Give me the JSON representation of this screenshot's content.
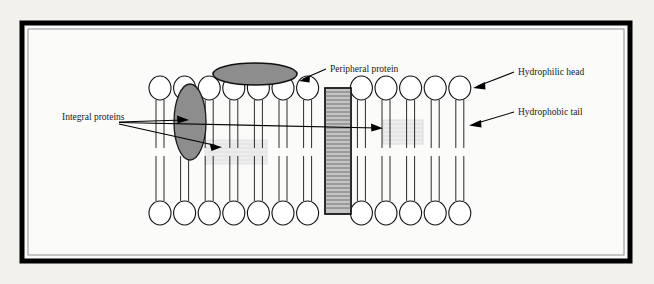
{
  "figure": {
    "kind": "cell-membrane-phospholipid-bilayer-diagram",
    "background_color": "#f2f1ee",
    "frame": {
      "outer_color": "#000000",
      "inner_line_color": "#8a8a8a",
      "fill_color": "#fbfbfa"
    }
  },
  "labels": {
    "peripheral_protein": "Peripheral protein",
    "integral_proteins": "Integral proteins",
    "hydrophilic_head": "Hydrophilic head",
    "hydrophobic_tail": "Hydrophobic tail"
  },
  "colors": {
    "head_fill": "#ffffff",
    "head_stroke": "#111111",
    "tail_stroke": "#222222",
    "protein_gray": "#8d8d8d",
    "protein_stroke": "#111111",
    "channel_gray": "#bdbdbd",
    "channel_stripe": "#8f8f8f",
    "faint_gray": "#e9e9e9",
    "arrow_color": "#000000"
  },
  "structure": {
    "top_head_count": 13,
    "bottom_head_count": 13,
    "head_rx": 11,
    "head_ry": 12,
    "top_head_cy": 88,
    "bottom_head_cy": 213,
    "first_head_cx": 160,
    "head_spacing": 24.6,
    "tail_offset": 4,
    "tail_top_y": 100,
    "tail_bottom_y": 201,
    "tail_break_top": 148,
    "tail_break_bottom": 156
  },
  "proteins": {
    "peripheral": {
      "cx": 255,
      "cy": 74,
      "rx": 42,
      "ry": 11
    },
    "integral_ellipse": {
      "cx": 190,
      "cy": 122,
      "rx": 16,
      "ry": 38
    },
    "integral_channel": {
      "x": 325,
      "y": 88,
      "width": 26,
      "height": 126,
      "stripe_rows": 30
    },
    "faint_left": {
      "x": 205,
      "y": 140,
      "width": 62,
      "height": 24,
      "stripe_rows": 5
    },
    "faint_right": {
      "x": 383,
      "y": 120,
      "width": 40,
      "height": 24,
      "stripe_rows": 5
    }
  },
  "annotations": [
    {
      "name": "peripheral-protein",
      "text_x": 330,
      "text_y": 72,
      "line": [
        [
          326,
          69
        ],
        [
          300,
          80
        ]
      ],
      "arrow_at": [
        300,
        80
      ],
      "arrow_angle": 155
    },
    {
      "name": "hydrophilic-head",
      "text_x": 518,
      "text_y": 75,
      "line": [
        [
          514,
          72
        ],
        [
          474,
          88
        ]
      ],
      "arrow_at": [
        474,
        88
      ],
      "arrow_angle": 158
    },
    {
      "name": "hydrophobic-tail",
      "text_x": 518,
      "text_y": 115,
      "line": [
        [
          514,
          112
        ],
        [
          470,
          125
        ]
      ],
      "arrow_at": [
        470,
        125
      ],
      "arrow_angle": 163
    },
    {
      "name": "integral-proteins",
      "text_x": 62,
      "text_y": 120,
      "lines": [
        [
          [
            119,
            122
          ],
          [
            190,
            120
          ]
        ],
        [
          [
            119,
            122
          ],
          [
            383,
            128
          ]
        ],
        [
          [
            119,
            124
          ],
          [
            222,
            147
          ]
        ]
      ],
      "arrows": [
        {
          "at": [
            190,
            120
          ],
          "angle": 358
        },
        {
          "at": [
            383,
            128
          ],
          "angle": 2
        },
        {
          "at": [
            222,
            147
          ],
          "angle": 13
        }
      ]
    }
  ]
}
